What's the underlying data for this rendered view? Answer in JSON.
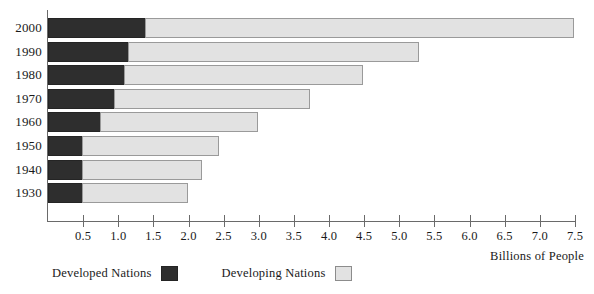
{
  "chart_data": {
    "type": "bar",
    "orientation": "horizontal",
    "stacked": true,
    "title": "",
    "xlabel": "Billions of People",
    "ylabel": "",
    "xlim": [
      0,
      7.5
    ],
    "grid": false,
    "legend_position": "bottom-left",
    "categories": [
      "2000",
      "1990",
      "1980",
      "1970",
      "1960",
      "1950",
      "1940",
      "1930"
    ],
    "xticks": [
      "0.5",
      "1.0",
      "1.5",
      "2.0",
      "2.5",
      "3.0",
      "3.5",
      "4.0",
      "4.5",
      "5.0",
      "5.5",
      "6.0",
      "6.5",
      "7.0",
      "7.5"
    ],
    "series": [
      {
        "name": "Developed Nations",
        "color": "#2e2e2e",
        "values": [
          1.4,
          1.15,
          1.1,
          0.95,
          0.75,
          0.5,
          0.5,
          0.5
        ]
      },
      {
        "name": "Developing Nations",
        "color": "#e2e2e2",
        "values": [
          6.1,
          4.15,
          3.4,
          2.8,
          2.25,
          1.95,
          1.7,
          1.5
        ]
      }
    ],
    "totals": [
      7.5,
      5.3,
      4.5,
      3.75,
      3.0,
      2.45,
      2.2,
      2.0
    ]
  },
  "legend": {
    "entries": [
      {
        "label": "Developed Nations",
        "swatch": "dark-square-swatch"
      },
      {
        "label": "Developing Nations",
        "swatch": "light-square-swatch"
      }
    ]
  }
}
